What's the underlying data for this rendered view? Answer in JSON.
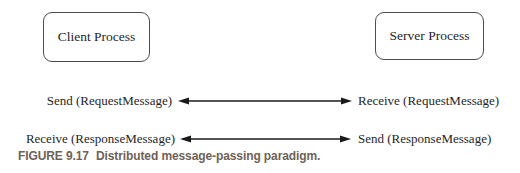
{
  "diagram": {
    "nodes": {
      "client": {
        "label": "Client Process"
      },
      "server": {
        "label": "Server Process"
      }
    },
    "messages": [
      {
        "left": "Send (RequestMessage)",
        "right": "Receive (RequestMessage)"
      },
      {
        "left": "Receive (ResponseMessage)",
        "right": "Send (ResponseMessage)"
      }
    ],
    "caption": {
      "label": "FIGURE 9.17",
      "text": "Distributed message-passing paradigm."
    },
    "colors": {
      "background": "#ffffff",
      "line": "#1a1a1a",
      "text": "#1f1f1f",
      "caption": "#6e6257"
    }
  }
}
